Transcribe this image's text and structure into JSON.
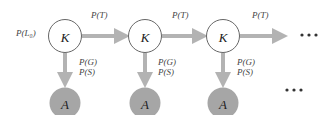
{
  "diagram": {
    "type": "hidden-markov-model / knowledge-tracing",
    "initial_prob_label": "P(L₀)",
    "colors": {
      "arrow": "#b3b3b3",
      "knowledge_node_fill": "#ffffff",
      "knowledge_node_stroke": "#555555",
      "answer_node_fill": "#a6a6a6",
      "text": "#333333"
    },
    "knowledge_nodes": [
      {
        "label": "K",
        "cx": 65,
        "cy": 36
      },
      {
        "label": "K",
        "cx": 145,
        "cy": 36
      },
      {
        "label": "K",
        "cx": 223,
        "cy": 36
      }
    ],
    "answer_nodes": [
      {
        "label": "A",
        "cx": 65,
        "cy": 103
      },
      {
        "label": "A",
        "cx": 145,
        "cy": 103
      },
      {
        "label": "A",
        "cx": 223,
        "cy": 103
      }
    ],
    "transition_label": "P(T)",
    "transitions": [
      {
        "label": "P(T)",
        "from": "start",
        "to": "K1"
      },
      {
        "label": "P(T)",
        "from": "K1",
        "to": "K2"
      },
      {
        "label": "P(T)",
        "from": "K2",
        "to": "K3"
      },
      {
        "label": "P(T)",
        "from": "K3",
        "to": "continuation"
      }
    ],
    "emission_labels": [
      "P(G)",
      "P(S)"
    ],
    "ellipsis": "•••"
  }
}
